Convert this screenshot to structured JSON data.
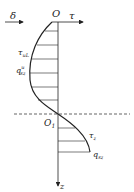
{
  "labels": {
    "delta": "δ",
    "origin": "O",
    "tau_axis": "τ",
    "tau_uL": "τ",
    "tau_uL_sub": "uL",
    "q_sz_u": "q",
    "q_sz_u_sup": "u",
    "q_sz_u_sub": "sz",
    "origin1": "O",
    "origin1_sub": "1",
    "tau_z": "τ",
    "tau_z_sub": "z",
    "q_sz": "q",
    "q_sz_sub": "sz",
    "z_axis": "z"
  },
  "colors": {
    "stroke": "#222222",
    "background": "#ffffff"
  }
}
